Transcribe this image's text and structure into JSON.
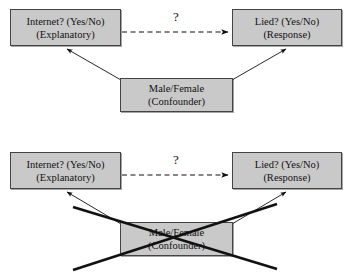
{
  "figure": {
    "type": "causal-confounder-diagram",
    "background_color": "#ffffff",
    "box_fill_color": "#c9c9c9",
    "box_border_color": "#444444",
    "line_color": "#1a1a1a",
    "panels": [
      {
        "id": "panel-top",
        "crossed_out": false,
        "nodes": [
          {
            "id": "explanatory",
            "role": "explanatory",
            "line1": "Internet? (Yes/No)",
            "line2": "(Explanatory)",
            "x": 10,
            "y": 9,
            "w": 111,
            "h": 37
          },
          {
            "id": "response",
            "role": "response",
            "line1": "Lied? (Yes/No)",
            "line2": "(Response)",
            "x": 232,
            "y": 9,
            "w": 110,
            "h": 37
          },
          {
            "id": "confounder",
            "role": "confounder",
            "line1": "Male/Female",
            "line2": "(Confounder)",
            "x": 120,
            "y": 78,
            "w": 113,
            "h": 34
          }
        ],
        "edges": [
          {
            "id": "explanatory-to-response",
            "from": "explanatory",
            "to": "response",
            "style": "dashed",
            "arrow": true,
            "label": "?"
          },
          {
            "id": "confounder-to-explanatory",
            "from": "confounder",
            "to": "explanatory",
            "style": "solid",
            "arrow": true,
            "label": ""
          },
          {
            "id": "confounder-to-response",
            "from": "confounder",
            "to": "response",
            "style": "solid",
            "arrow": true,
            "label": ""
          }
        ]
      },
      {
        "id": "panel-bottom",
        "crossed_out": true,
        "nodes": [
          {
            "id": "explanatory",
            "role": "explanatory",
            "line1": "Internet? (Yes/No)",
            "line2": "(Explanatory)",
            "x": 10,
            "y": 152,
            "w": 111,
            "h": 37
          },
          {
            "id": "response",
            "role": "response",
            "line1": "Lied? (Yes/No)",
            "line2": "(Response)",
            "x": 232,
            "y": 152,
            "w": 110,
            "h": 37
          },
          {
            "id": "confounder",
            "role": "confounder",
            "line1": "Male/Female",
            "line2": "(Confounder)",
            "x": 120,
            "y": 222,
            "w": 113,
            "h": 34
          }
        ],
        "edges": [
          {
            "id": "explanatory-to-response",
            "from": "explanatory",
            "to": "response",
            "style": "dashed",
            "arrow": true,
            "label": "?"
          },
          {
            "id": "confounder-to-explanatory",
            "from": "confounder",
            "to": "explanatory",
            "style": "solid",
            "arrow": true,
            "label": ""
          },
          {
            "id": "confounder-to-response",
            "from": "confounder",
            "to": "response",
            "style": "solid",
            "arrow": true,
            "label": ""
          }
        ],
        "cross_out": {
          "stroke_width": 2.6,
          "color": "#111111"
        }
      }
    ]
  }
}
